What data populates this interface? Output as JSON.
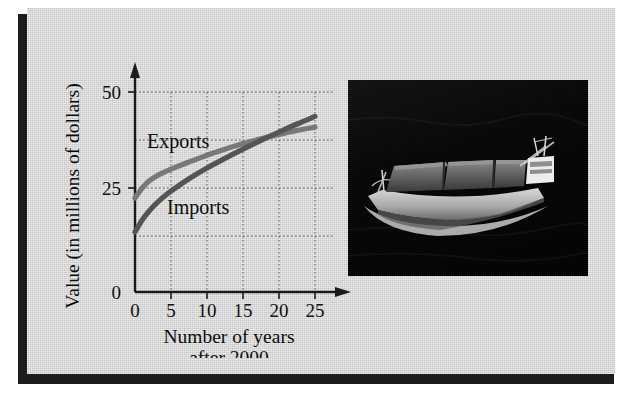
{
  "figure": {
    "kind": "textbook-figure",
    "panel_color": "#cfcfcf",
    "frame_shadow_color": "#1d1d1d"
  },
  "chart_data": {
    "type": "line",
    "title": "",
    "xlabel_line1": "Number of years",
    "xlabel_line2": "after 2000",
    "ylabel": "Value (in millions of dollars)",
    "xlim": [
      0,
      27
    ],
    "ylim": [
      0,
      53
    ],
    "xticks": [
      0,
      5,
      10,
      15,
      20,
      25
    ],
    "xtick_labels": [
      "0",
      "5",
      "10",
      "15",
      "20",
      "25"
    ],
    "yticks": [
      0,
      25,
      50
    ],
    "ytick_labels": [
      "0",
      "25",
      "50"
    ],
    "grid": true,
    "grid_style": "dotted",
    "x_gridlines": [
      5,
      10,
      15,
      20,
      25
    ],
    "y_gridlines": [
      12.5,
      25,
      37.5,
      50
    ],
    "legend_position": "inline-annotations",
    "axis_arrows": true,
    "series": [
      {
        "name": "Exports",
        "color": "#787878",
        "label_text": "Exports",
        "x": [
          0,
          1,
          2,
          3,
          4,
          5,
          7.5,
          10,
          12.5,
          15,
          17.5,
          20,
          22.5,
          25
        ],
        "values": [
          23.5,
          26.0,
          27.8,
          29.0,
          29.9,
          30.7,
          32.5,
          34.2,
          35.7,
          37.1,
          38.3,
          39.4,
          40.4,
          41.2
        ]
      },
      {
        "name": "Imports",
        "color": "#555555",
        "label_text": "Imports",
        "x": [
          0,
          1,
          2,
          3,
          4,
          5,
          7.5,
          10,
          12.5,
          15,
          17.5,
          20,
          22.5,
          25
        ],
        "values": [
          15.0,
          18.0,
          20.3,
          22.2,
          23.8,
          25.2,
          28.3,
          31.0,
          33.4,
          35.7,
          37.9,
          40.0,
          42.0,
          43.9
        ]
      }
    ],
    "crossing_point": {
      "x": 11.5,
      "y": 34.8
    }
  },
  "photo": {
    "caption": "",
    "subject": "container cargo ship at sea",
    "water_color": "#0b0b0b",
    "hull_color": "#c9c9c9",
    "container_color": "#6b6b6b",
    "superstructure_color": "#e6e6e6"
  }
}
